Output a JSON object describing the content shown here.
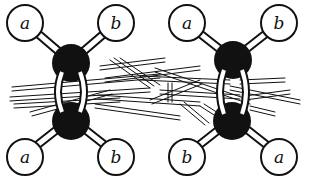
{
  "diagram": {
    "colors": {
      "carbon": "#111111",
      "substituent_fill": "#ffffff",
      "stroke": "#111111",
      "background": "#ffffff"
    },
    "molecules": [
      {
        "id": "left",
        "isomer": "cis",
        "top_left": "a",
        "top_right": "b",
        "bottom_left": "a",
        "bottom_right": "b"
      },
      {
        "id": "right",
        "isomer": "trans",
        "top_left": "a",
        "top_right": "b",
        "bottom_left": "b",
        "bottom_right": "a"
      }
    ]
  }
}
